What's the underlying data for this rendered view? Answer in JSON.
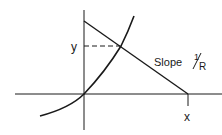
{
  "diagram": {
    "labels": {
      "y": "y",
      "x": "x",
      "slope_text": "Slope",
      "slope_num": "1",
      "slope_den": "R"
    },
    "colors": {
      "stroke": "#1a1a1a",
      "background": "#ffffff"
    },
    "geometry": {
      "axis_origin": [
        84,
        94
      ],
      "load_line": {
        "from": [
          84,
          21
        ],
        "to": [
          188,
          94
        ]
      },
      "intersection": [
        121,
        46
      ],
      "curve": {
        "start": [
          40,
          116
        ],
        "end": [
          134,
          16
        ]
      }
    }
  }
}
